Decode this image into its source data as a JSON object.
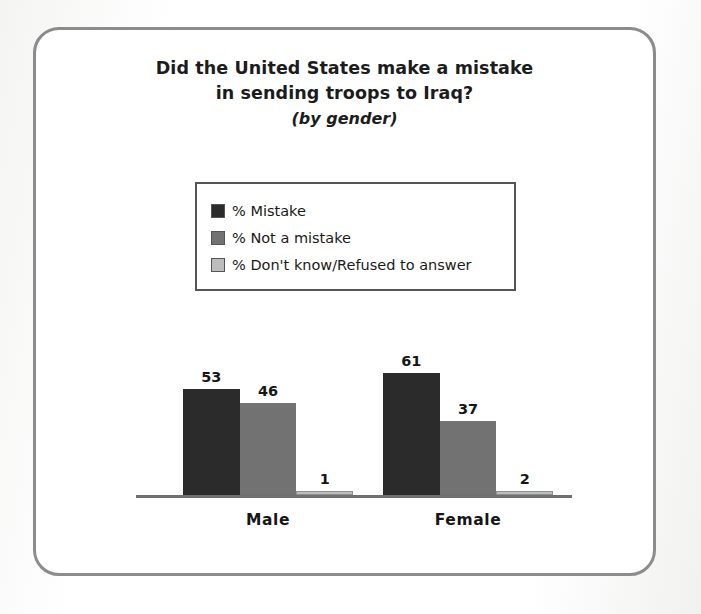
{
  "chart_data": {
    "type": "bar",
    "title": "Did the United States make a mistake in sending troops to Iraq?",
    "title_line1": "Did the United States make a mistake",
    "title_line2": "in sending troops to Iraq?",
    "subtitle": "(by gender)",
    "xlabel": "",
    "ylabel": "",
    "ylim": [
      0,
      100
    ],
    "grid": false,
    "legend_position": "top-center",
    "categories": [
      "Male",
      "Female"
    ],
    "series": [
      {
        "name": "% Mistake",
        "color": "#2b2b2b",
        "values": [
          53,
          61
        ]
      },
      {
        "name": "% Not a mistake",
        "color": "#727272",
        "values": [
          46,
          37
        ]
      },
      {
        "name": "% Don't know/Refused to answer",
        "color": "#bdbdbd",
        "values": [
          1,
          2
        ]
      }
    ],
    "value_labels": {
      "Male": [
        "53",
        "46",
        "1"
      ],
      "Female": [
        "61",
        "37",
        "2"
      ]
    }
  },
  "legend": {
    "items": [
      {
        "label": "% Mistake",
        "color": "#2b2b2b"
      },
      {
        "label": "% Not a mistake",
        "color": "#727272"
      },
      {
        "label": "% Don't know/Refused to answer",
        "color": "#bdbdbd"
      }
    ]
  },
  "colors": {
    "frame": "#8c8c8c",
    "baseline": "#6f6f6f",
    "text": "#1a1a1a",
    "background": "#ffffff"
  }
}
